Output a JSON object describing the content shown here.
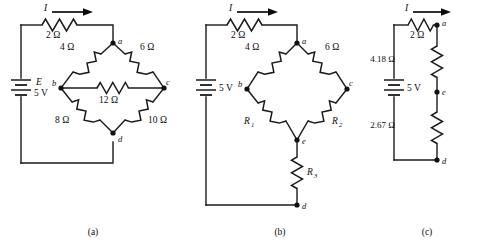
{
  "figure": {
    "background_color": "#ffffff",
    "line_color": "#1a1a1a"
  },
  "panels": [
    {
      "id": "a",
      "caption": "(a)",
      "description": "Wheatstone-style bridge network with five resistors between nodes a, b, c, d",
      "source": {
        "symbol_label": "E",
        "value_label": "5 V"
      },
      "current": {
        "label": "I",
        "direction": "right"
      },
      "series_resistor": "2 Ω",
      "nodes": [
        "a",
        "b",
        "c",
        "d"
      ],
      "resistors": [
        {
          "name": "series-2-ohm",
          "label": "2 Ω",
          "between": "supply-to-a"
        },
        {
          "name": "ab-4-ohm",
          "label": "4 Ω",
          "between": "a-b"
        },
        {
          "name": "ac-6-ohm",
          "label": "6 Ω",
          "between": "a-c"
        },
        {
          "name": "bc-12-ohm",
          "label": "12 Ω",
          "between": "b-c"
        },
        {
          "name": "bd-8-ohm",
          "label": "8 Ω",
          "between": "b-d"
        },
        {
          "name": "cd-10-ohm",
          "label": "10 Ω",
          "between": "c-d"
        }
      ]
    },
    {
      "id": "b",
      "caption": "(b)",
      "description": "Equivalent delta-to-wye transformed bridge with unknown resistors R1, R2, R3",
      "source": {
        "symbol_label": "",
        "value_label": "5 V"
      },
      "current": {
        "label": "I",
        "direction": "right"
      },
      "series_resistor": "2 Ω",
      "nodes": [
        "a",
        "b",
        "c",
        "d",
        "e"
      ],
      "resistors": [
        {
          "name": "series-2-ohm",
          "label": "2 Ω",
          "between": "supply-to-a"
        },
        {
          "name": "ab-4-ohm",
          "label": "4 Ω",
          "between": "a-b"
        },
        {
          "name": "ac-6-ohm",
          "label": "6 Ω",
          "between": "a-c"
        },
        {
          "name": "be-r1",
          "label": "R",
          "sub": "1",
          "between": "b-e"
        },
        {
          "name": "ce-r2",
          "label": "R",
          "sub": "2",
          "between": "c-e"
        },
        {
          "name": "ed-r3",
          "label": "R",
          "sub": "3",
          "between": "e-d"
        }
      ]
    },
    {
      "id": "c",
      "caption": "(c)",
      "description": "Reduced single-loop equivalent circuit with series resistors",
      "source": {
        "symbol_label": "",
        "value_label": "5 V"
      },
      "current": {
        "label": "I",
        "direction": "right"
      },
      "series_resistor": "2 Ω",
      "nodes": [
        "a",
        "e",
        "d"
      ],
      "resistors": [
        {
          "name": "series-2-ohm",
          "label": "2 Ω",
          "between": "supply-to-a"
        },
        {
          "name": "ae-4p18-ohm",
          "label": "4.18 Ω",
          "between": "a-e"
        },
        {
          "name": "ed-2p67-ohm",
          "label": "2.67 Ω",
          "between": "e-d"
        }
      ]
    }
  ],
  "captions": {
    "a": "(a)",
    "b": "(b)",
    "c": "(c)"
  },
  "labels": {
    "ohm_2": "2 Ω",
    "ohm_4": "4 Ω",
    "ohm_6": "6 Ω",
    "ohm_8": "8 Ω",
    "ohm_10": "10 Ω",
    "ohm_12": "12 Ω",
    "ohm_418": "4.18 Ω",
    "ohm_267": "2.67 Ω",
    "emf_E": "E",
    "volts_5": "5 V",
    "current_I": "I",
    "R": "R",
    "sub1": "1",
    "sub2": "2",
    "sub3": "3",
    "node_a": "a",
    "node_b": "b",
    "node_c": "c",
    "node_d": "d",
    "node_e": "e"
  }
}
